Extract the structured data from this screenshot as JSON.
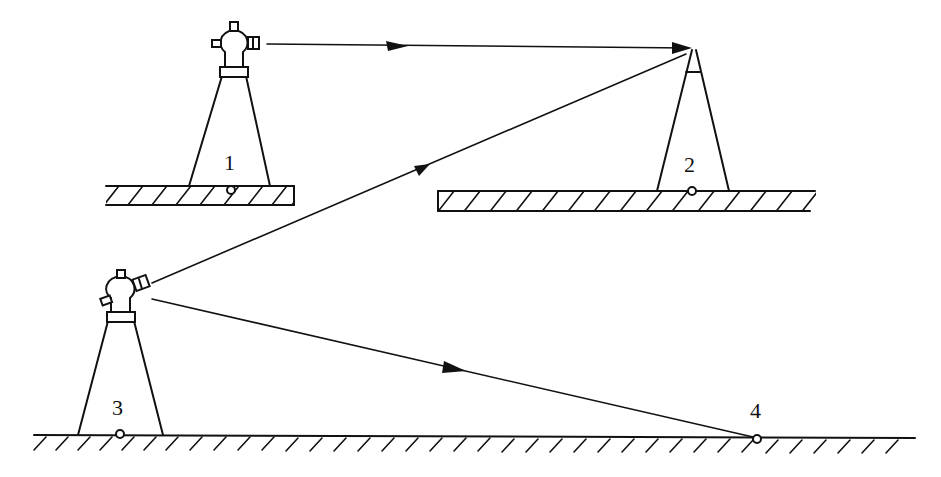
{
  "diagram": {
    "type": "surveying-traverse-schematic",
    "colors": {
      "stroke": "#111111",
      "background": "#ffffff"
    },
    "stations": [
      {
        "id": "1",
        "label": "1",
        "role": "instrument (theodolite) on elevated ground"
      },
      {
        "id": "2",
        "label": "2",
        "role": "target on elevated ground"
      },
      {
        "id": "3",
        "label": "3",
        "role": "instrument (theodolite) on ground"
      },
      {
        "id": "4",
        "label": "4",
        "role": "ground point"
      }
    ],
    "sightlines": [
      {
        "from": "1",
        "to": "2",
        "arrow": "toward-2"
      },
      {
        "from": "3",
        "to": "2",
        "arrow": "toward-2"
      },
      {
        "from": "3",
        "to": "4",
        "arrow": "toward-4"
      }
    ],
    "ground": [
      {
        "name": "platform-1",
        "style": "hatched-slab"
      },
      {
        "name": "platform-2",
        "style": "hatched-slab"
      },
      {
        "name": "ground-line",
        "style": "hatched-line"
      }
    ]
  }
}
